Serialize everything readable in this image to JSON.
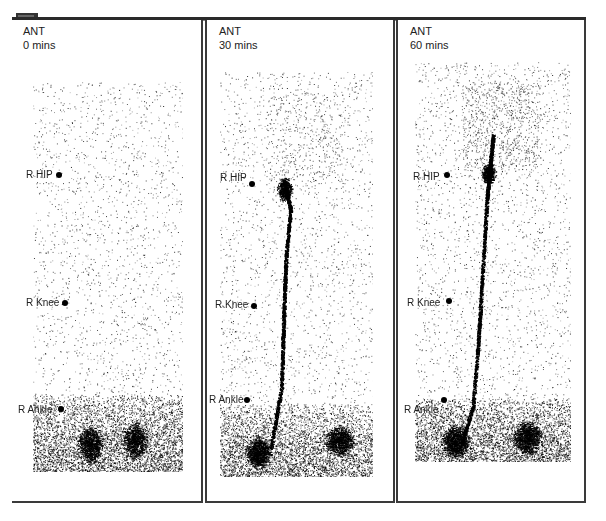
{
  "viewer": {
    "corner_badge_icon": "image-series-badge",
    "panels": [
      {
        "view": "ANT",
        "time": "0 mins",
        "markers": [
          {
            "label": "R HIP"
          },
          {
            "label": "R Knee"
          },
          {
            "label": "R Ankle"
          }
        ],
        "lymphatic_channel_visible": false
      },
      {
        "view": "ANT",
        "time": "30 mins",
        "markers": [
          {
            "label": "R HIP"
          },
          {
            "label": "R Knee"
          },
          {
            "label": "R Ankle"
          }
        ],
        "lymphatic_channel_visible": true
      },
      {
        "view": "ANT",
        "time": "60 mins",
        "markers": [
          {
            "label": "R HIP"
          },
          {
            "label": "R Knee"
          },
          {
            "label": "R Ankle"
          }
        ],
        "lymphatic_channel_visible": true
      }
    ]
  }
}
